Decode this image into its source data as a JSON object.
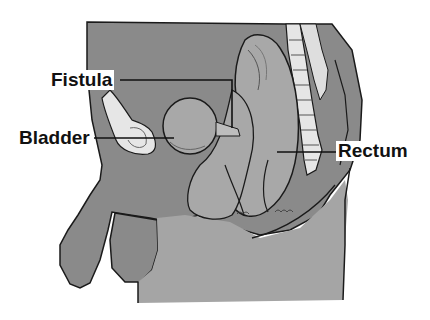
{
  "diagram": {
    "type": "anatomical-cross-section",
    "colors": {
      "background": "#ffffff",
      "body_tissue": "#8a8a8a",
      "organ": "#a8a8a8",
      "lower_region": "#a5a5a5",
      "bone": "#e6e6e6",
      "outline": "#1a1a1a"
    },
    "labels": [
      {
        "id": "fistula",
        "text": "Fistula",
        "x": 49,
        "y": 72
      },
      {
        "id": "bladder",
        "text": "Bladder",
        "x": 17,
        "y": 130
      },
      {
        "id": "rectum",
        "text": "Rectum",
        "x": 336,
        "y": 143
      }
    ]
  }
}
